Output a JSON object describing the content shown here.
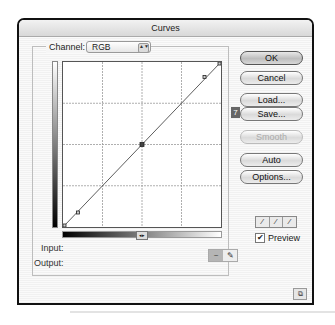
{
  "window": {
    "title": "Curves"
  },
  "channel": {
    "label": "Channel:",
    "value": "RGB"
  },
  "graph": {
    "grid": "4x4",
    "curve_points": [
      [
        0,
        0
      ],
      [
        25,
        23
      ],
      [
        50,
        50
      ],
      [
        91,
        89
      ],
      [
        100,
        100
      ]
    ],
    "toggle_icon": "gradient-direction-toggle-icon"
  },
  "labels": {
    "input": "Input:",
    "output": "Output:"
  },
  "tools": {
    "curve": "~",
    "pencil": "✎"
  },
  "buttons": {
    "ok": "OK",
    "cancel": "Cancel",
    "load": "Load...",
    "save": "Save...",
    "smooth": "Smooth",
    "auto": "Auto",
    "options": "Options..."
  },
  "save_badge": "7",
  "eyedroppers": [
    "black-point",
    "gray-point",
    "white-point"
  ],
  "eyedropper_glyph": "⁄",
  "preview": {
    "label": "Preview",
    "checked": true,
    "check": "✔"
  },
  "resize_glyph": "⧉",
  "toggle_glyph": "◂▸",
  "select_arrows": "▲▼"
}
